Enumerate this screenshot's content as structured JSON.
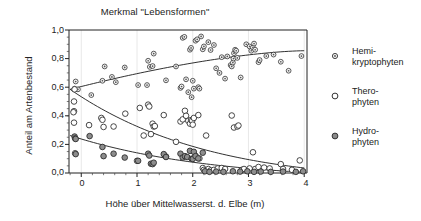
{
  "chart_data": {
    "type": "scatter",
    "title": "Merkmal \"Lebensformen\"",
    "xlabel": "Höhe über Mittelwasserst. d. Elbe (m)",
    "ylabel": "Anteil am Artenbestand",
    "xlim": [
      -0.22,
      4.05
    ],
    "ylim": [
      0.0,
      1.0
    ],
    "xticks": [
      0,
      1,
      2,
      3,
      4
    ],
    "xtick_labels": [
      "0",
      "1",
      "2",
      "3",
      "4"
    ],
    "yticks": [
      0.0,
      0.2,
      0.4,
      0.6,
      0.8,
      1.0
    ],
    "ytick_labels": [
      "0,0",
      "0,2",
      "0,4",
      "0,6",
      "0,8",
      "1,0"
    ],
    "grid": "vertical-faint",
    "legend_position": "right",
    "series": [
      {
        "name": "Hemi-kryptophyten",
        "marker": "small-diamond",
        "color": "#333333",
        "fill": "#f2f2f2",
        "points": [
          [
            -0.1,
            0.64
          ],
          [
            -0.12,
            0.59
          ],
          [
            -0.06,
            0.585
          ],
          [
            0.18,
            0.545
          ],
          [
            0.38,
            0.645
          ],
          [
            0.42,
            0.745
          ],
          [
            0.55,
            0.672
          ],
          [
            0.62,
            0.635
          ],
          [
            0.78,
            0.738
          ],
          [
            1.02,
            0.615
          ],
          [
            1.18,
            0.615
          ],
          [
            1.2,
            0.785
          ],
          [
            1.23,
            0.742
          ],
          [
            1.28,
            0.748
          ],
          [
            1.3,
            0.835
          ],
          [
            1.52,
            0.648
          ],
          [
            1.7,
            0.745
          ],
          [
            1.78,
            0.595
          ],
          [
            1.8,
            0.605
          ],
          [
            1.82,
            0.945
          ],
          [
            1.85,
            0.952
          ],
          [
            1.88,
            0.655
          ],
          [
            1.92,
            0.565
          ],
          [
            1.95,
            0.862
          ],
          [
            1.97,
            0.875
          ],
          [
            1.98,
            0.53
          ],
          [
            2.0,
            0.645
          ],
          [
            2.02,
            0.59
          ],
          [
            2.05,
            0.925
          ],
          [
            2.08,
            0.935
          ],
          [
            2.1,
            0.6
          ],
          [
            2.12,
            0.59
          ],
          [
            2.15,
            0.955
          ],
          [
            2.18,
            0.865
          ],
          [
            2.2,
            0.885
          ],
          [
            2.28,
            0.915
          ],
          [
            2.32,
            0.86
          ],
          [
            2.38,
            0.895
          ],
          [
            2.42,
            0.732
          ],
          [
            2.48,
            0.7
          ],
          [
            2.52,
            0.81
          ],
          [
            2.58,
            0.66
          ],
          [
            2.62,
            0.815
          ],
          [
            2.68,
            0.755
          ],
          [
            2.7,
            0.745
          ],
          [
            2.72,
            0.772
          ],
          [
            2.73,
            0.8
          ],
          [
            2.74,
            0.838
          ],
          [
            2.76,
            0.862
          ],
          [
            2.78,
            0.855
          ],
          [
            2.8,
            0.805
          ],
          [
            2.86,
            0.668
          ],
          [
            2.96,
            0.9
          ],
          [
            3.02,
            0.885
          ],
          [
            3.05,
            0.855
          ],
          [
            3.08,
            0.878
          ],
          [
            3.1,
            0.905
          ],
          [
            3.12,
            0.862
          ],
          [
            3.18,
            0.775
          ],
          [
            3.2,
            0.79
          ],
          [
            3.32,
            0.818
          ],
          [
            3.45,
            0.828
          ],
          [
            3.58,
            0.778
          ],
          [
            3.72,
            0.715
          ],
          [
            3.95,
            0.818
          ]
        ]
      },
      {
        "name": "Thero-phyten",
        "marker": "open-circle",
        "color": "#333333",
        "fill": "none",
        "points": [
          [
            -0.12,
            0.585
          ],
          [
            -0.13,
            0.5
          ],
          [
            -0.13,
            0.432
          ],
          [
            -0.14,
            0.425
          ],
          [
            -0.13,
            0.352
          ],
          [
            -0.11,
            0.138
          ],
          [
            0.14,
            0.335
          ],
          [
            0.36,
            0.385
          ],
          [
            0.38,
            0.372
          ],
          [
            0.4,
            0.322
          ],
          [
            0.58,
            0.325
          ],
          [
            0.79,
            0.415
          ],
          [
            1.0,
            0.085
          ],
          [
            1.05,
            0.455
          ],
          [
            1.12,
            0.262
          ],
          [
            1.2,
            0.478
          ],
          [
            1.22,
            0.465
          ],
          [
            1.25,
            0.272
          ],
          [
            1.28,
            0.345
          ],
          [
            1.3,
            0.325
          ],
          [
            1.32,
            0.328
          ],
          [
            1.48,
            0.405
          ],
          [
            1.52,
            0.115
          ],
          [
            1.7,
            0.218
          ],
          [
            1.78,
            0.36
          ],
          [
            1.82,
            0.375
          ],
          [
            1.86,
            0.435
          ],
          [
            1.88,
            0.4
          ],
          [
            1.92,
            0.365
          ],
          [
            1.95,
            0.345
          ],
          [
            1.97,
            0.37
          ],
          [
            1.99,
            0.365
          ],
          [
            2.0,
            0.338
          ],
          [
            2.02,
            0.385
          ],
          [
            2.05,
            0.12
          ],
          [
            2.1,
            0.405
          ],
          [
            2.12,
            0.102
          ],
          [
            2.18,
            0.035
          ],
          [
            2.2,
            0.022
          ],
          [
            2.24,
            0.262
          ],
          [
            2.28,
            0.028
          ],
          [
            2.32,
            0.018
          ],
          [
            2.38,
            0.022
          ],
          [
            2.45,
            0.032
          ],
          [
            2.52,
            0.035
          ],
          [
            2.58,
            0.028
          ],
          [
            2.7,
            0.402
          ],
          [
            2.74,
            0.318
          ],
          [
            2.8,
            0.325
          ],
          [
            2.82,
            0.332
          ],
          [
            2.88,
            0.022
          ],
          [
            2.92,
            0.028
          ],
          [
            3.02,
            0.032
          ],
          [
            3.08,
            0.145
          ],
          [
            3.12,
            0.028
          ],
          [
            3.18,
            0.042
          ],
          [
            3.28,
            0.038
          ],
          [
            3.38,
            0.032
          ],
          [
            3.58,
            0.062
          ],
          [
            3.62,
            0.028
          ],
          [
            3.78,
            0.022
          ],
          [
            3.92,
            0.088
          ]
        ]
      },
      {
        "name": "Hydro-phyten",
        "marker": "filled-circle",
        "color": "#333333",
        "fill": "#8a8a8a",
        "points": [
          [
            -0.12,
            0.255
          ],
          [
            -0.11,
            0.242
          ],
          [
            -0.1,
            0.238
          ],
          [
            -0.1,
            0.132
          ],
          [
            0.15,
            0.258
          ],
          [
            0.38,
            0.182
          ],
          [
            0.4,
            0.118
          ],
          [
            0.58,
            0.135
          ],
          [
            0.78,
            0.108
          ],
          [
            1.02,
            0.085
          ],
          [
            1.2,
            0.135
          ],
          [
            1.22,
            0.122
          ],
          [
            1.25,
            0.065
          ],
          [
            1.28,
            0.062
          ],
          [
            1.3,
            0.072
          ],
          [
            1.48,
            0.132
          ],
          [
            1.52,
            0.112
          ],
          [
            1.78,
            0.135
          ],
          [
            1.82,
            0.108
          ],
          [
            1.86,
            0.118
          ],
          [
            1.9,
            0.112
          ],
          [
            1.95,
            0.155
          ],
          [
            1.98,
            0.1
          ],
          [
            2.0,
            0.098
          ],
          [
            2.02,
            0.148
          ],
          [
            2.05,
            0.118
          ],
          [
            2.1,
            0.102
          ],
          [
            2.18,
            0.142
          ],
          [
            2.22,
            0.012
          ],
          [
            2.3,
            0.008
          ],
          [
            2.42,
            0.01
          ],
          [
            2.55,
            0.008
          ],
          [
            2.72,
            0.012
          ],
          [
            2.85,
            0.01
          ],
          [
            2.98,
            0.012
          ],
          [
            3.1,
            0.008
          ],
          [
            3.22,
            0.01
          ],
          [
            3.4,
            0.008
          ],
          [
            3.62,
            0.01
          ],
          [
            3.85,
            0.008
          ],
          [
            3.98,
            0.012
          ]
        ]
      }
    ],
    "trend_lines": [
      {
        "name": "Hemikryptophyten-trend",
        "start": [
          -0.2,
          0.585
        ],
        "end": [
          4.0,
          0.855
        ],
        "shape": "slight-concave-rising"
      },
      {
        "name": "Therophyten-trend",
        "start": [
          -0.2,
          0.585
        ],
        "end": [
          4.0,
          0.035
        ],
        "shape": "convex-falling"
      },
      {
        "name": "Hydrophyten-trend",
        "start": [
          -0.2,
          0.262
        ],
        "end": [
          4.0,
          0.005
        ],
        "shape": "convex-falling"
      }
    ]
  },
  "legend": {
    "items": [
      {
        "label_line1": "Hemi-",
        "label_line2": "kryptophyten",
        "marker": "small-diamond"
      },
      {
        "label_line1": "Thero-",
        "label_line2": "phyten",
        "marker": "open-circle"
      },
      {
        "label_line1": "Hydro-",
        "label_line2": "phyten",
        "marker": "filled-circle"
      }
    ]
  }
}
